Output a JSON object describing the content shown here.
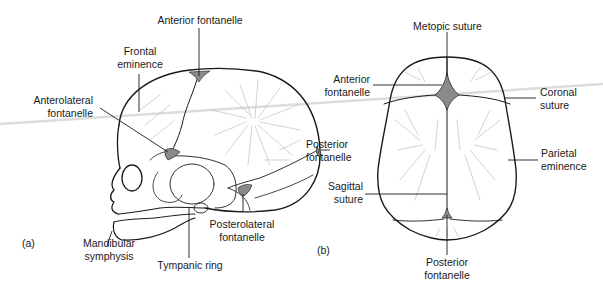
{
  "figure": {
    "panel_a": {
      "tag": "(a)",
      "view": "lateral",
      "labels": {
        "anterior_fontanelle": "Anterior fontanelle",
        "frontal_eminence_1": "Frontal",
        "frontal_eminence_2": "eminence",
        "anterolateral_fontanelle_1": "Anterolateral",
        "anterolateral_fontanelle_2": "fontanelle",
        "posterior_fontanelle_1": "Posterior",
        "posterior_fontanelle_2": "fontanelle",
        "posterolateral_fontanelle_1": "Posterolateral",
        "posterolateral_fontanelle_2": "fontanelle",
        "mandibular_symphysis_1": "Mandibular",
        "mandibular_symphysis_2": "symphysis",
        "tympanic_ring": "Tympanic ring"
      }
    },
    "panel_b": {
      "tag": "(b)",
      "view": "superior",
      "labels": {
        "metopic_suture": "Metopic suture",
        "anterior_fontanelle_1": "Anterior",
        "anterior_fontanelle_2": "fontanelle",
        "coronal_suture_1": "Coronal",
        "coronal_suture_2": "suture",
        "parietal_eminence_1": "Parietal",
        "parietal_eminence_2": "eminence",
        "sagittal_suture_1": "Sagittal",
        "sagittal_suture_2": "suture",
        "posterior_fontanelle_1": "Posterior",
        "posterior_fontanelle_2": "fontanelle"
      }
    },
    "colors": {
      "line": "#1a1a1a",
      "fontanelle_fill": "#8a8a8a",
      "hatch": "#b5b5b5",
      "scan_line": "#d8d8d8"
    }
  }
}
